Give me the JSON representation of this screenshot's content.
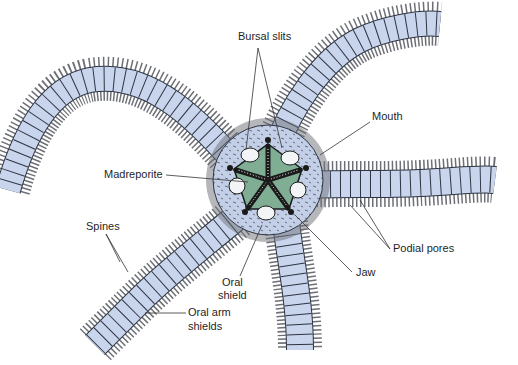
{
  "diagram": {
    "colors": {
      "arm_fill": "#c9d5ec",
      "arm_outline": "#2e3442",
      "spine": "#5b5e63",
      "disk_fill": "#c3cfe6",
      "oral_shield": "#7fae94",
      "jaw": "#1a1a1a",
      "bursal_slit": "#f3f4f6",
      "label_line": "#333333",
      "background": "#ffffff"
    },
    "labels": [
      {
        "id": "bursal-slits",
        "text": "Bursal slits",
        "x": 238,
        "y": 36
      },
      {
        "id": "mouth",
        "text": "Mouth",
        "x": 372,
        "y": 115
      },
      {
        "id": "madreporite",
        "text": "Madreporite",
        "x": 104,
        "y": 170
      },
      {
        "id": "spines",
        "text": "Spines",
        "x": 86,
        "y": 222
      },
      {
        "id": "podial-pores",
        "text": "Podial pores",
        "x": 392,
        "y": 243
      },
      {
        "id": "jaw",
        "text": "Jaw",
        "x": 355,
        "y": 267
      },
      {
        "id": "oral-shield-1",
        "text": "Oral",
        "x": 220,
        "y": 278
      },
      {
        "id": "oral-shield-2",
        "text": "shield",
        "x": 220,
        "y": 291
      },
      {
        "id": "oral-arm-shields-1",
        "text": "Oral arm",
        "x": 188,
        "y": 308
      },
      {
        "id": "oral-arm-shields-2",
        "text": "shields",
        "x": 188,
        "y": 322
      }
    ]
  }
}
